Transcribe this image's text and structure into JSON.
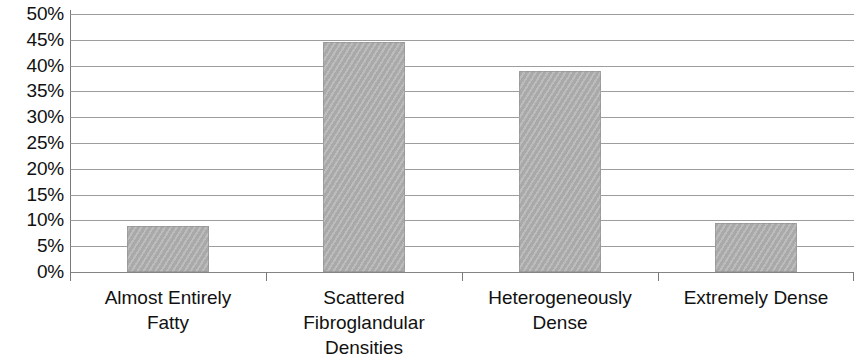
{
  "chart_data": {
    "type": "bar",
    "title": "",
    "subtitle": "",
    "xlabel": "",
    "ylabel": "",
    "categories": [
      "Almost Entirely Fatty",
      "Scattered Fibroglandular Densities",
      "Heterogeneously Dense",
      "Extremely Dense"
    ],
    "category_lines": [
      [
        "Almost Entirely",
        "Fatty"
      ],
      [
        "Scattered",
        "Fibroglandular",
        "Densities"
      ],
      [
        "Heterogeneously",
        "Dense"
      ],
      [
        "Extremely Dense"
      ]
    ],
    "values": [
      9,
      44.5,
      39,
      9.5
    ],
    "ylim": [
      0,
      50
    ],
    "ytick_step": 5,
    "ytick_labels": [
      "50%",
      "45%",
      "40%",
      "35%",
      "30%",
      "25%",
      "20%",
      "15%",
      "10%",
      "5%",
      "0%"
    ],
    "ytick_values": [
      50,
      45,
      40,
      35,
      30,
      25,
      20,
      15,
      10,
      5,
      0
    ],
    "grid": true,
    "legend": false,
    "legend_position": "none",
    "bar_color": "#b2b2b2",
    "grid_color": "#8c8c8c",
    "axis_color": "#7a7a7a",
    "text_color": "#111111"
  }
}
